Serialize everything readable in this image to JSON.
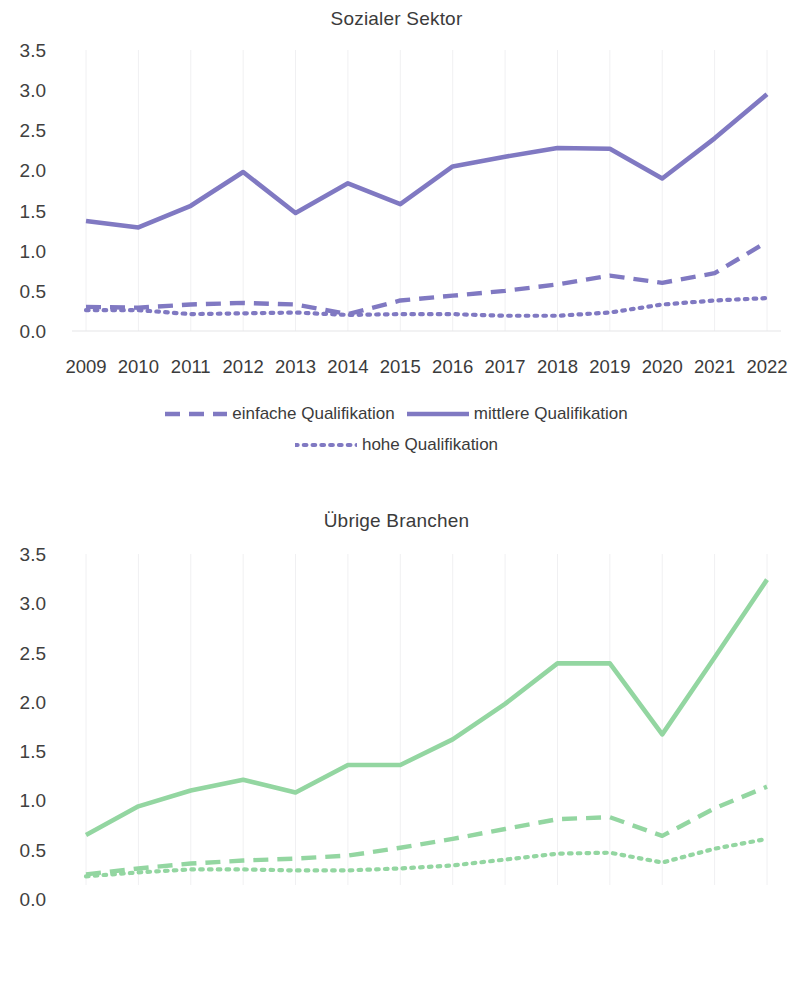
{
  "charts": [
    {
      "id": "sozialer-sektor",
      "title": "Sozialer Sektor",
      "color": "#8079c2",
      "legend_rows": [
        [
          "einfache Qualifikation",
          "mittlere Qualifikation"
        ],
        [
          "hohe Qualifikation"
        ]
      ]
    },
    {
      "id": "uebrige-branchen",
      "title": "Übrige Branchen",
      "color": "#93d6a1",
      "legend_rows": [
        [
          "einfache Qualifikation",
          "mittlere Qualifikation",
          "hohe Qualifikation"
        ]
      ]
    }
  ],
  "yticks": [
    "3.5",
    "3.0",
    "2.5",
    "2.0",
    "1.5",
    "1.0",
    "0.5",
    "0.0"
  ],
  "xticks": [
    "2009",
    "2010",
    "2011",
    "2012",
    "2013",
    "2014",
    "2015",
    "2016",
    "2017",
    "2018",
    "2019",
    "2020",
    "2021",
    "2022"
  ],
  "chart_data": [
    {
      "type": "line",
      "title": "Sozialer Sektor",
      "xlabel": "",
      "ylabel": "",
      "ylim": [
        0.0,
        3.5
      ],
      "ytick_values": [
        0.0,
        0.5,
        1.0,
        1.5,
        2.0,
        2.5,
        3.0,
        3.5
      ],
      "grid": true,
      "legend_position": "bottom",
      "color": "#8079c2",
      "categories": [
        "2009",
        "2010",
        "2011",
        "2012",
        "2013",
        "2014",
        "2015",
        "2016",
        "2017",
        "2018",
        "2019",
        "2020",
        "2021",
        "2022"
      ],
      "series": [
        {
          "name": "einfache Qualifikation",
          "style": "dashed",
          "values": [
            0.3,
            0.29,
            0.33,
            0.35,
            0.33,
            0.21,
            0.38,
            0.44,
            0.5,
            0.58,
            0.69,
            0.6,
            0.72,
            1.11
          ]
        },
        {
          "name": "mittlere Qualifikation",
          "style": "solid",
          "values": [
            1.37,
            1.29,
            1.56,
            1.98,
            1.47,
            1.84,
            1.58,
            2.05,
            2.17,
            2.28,
            2.27,
            1.9,
            2.4,
            2.95
          ]
        },
        {
          "name": "hohe Qualifikation",
          "style": "dotted",
          "values": [
            0.26,
            0.26,
            0.21,
            0.22,
            0.23,
            0.2,
            0.21,
            0.21,
            0.19,
            0.19,
            0.23,
            0.33,
            0.38,
            0.41
          ]
        }
      ]
    },
    {
      "type": "line",
      "title": "Übrige Branchen",
      "xlabel": "",
      "ylabel": "",
      "ylim": [
        0.0,
        3.5
      ],
      "ytick_values": [
        0.0,
        0.5,
        1.0,
        1.5,
        2.0,
        2.5,
        3.0,
        3.5
      ],
      "grid": true,
      "legend_position": "bottom",
      "color": "#93d6a1",
      "categories": [
        "2009",
        "2010",
        "2011",
        "2012",
        "2013",
        "2014",
        "2015",
        "2016",
        "2017",
        "2018",
        "2019",
        "2020",
        "2021",
        "2022"
      ],
      "series": [
        {
          "name": "einfache Qualifikation",
          "style": "dashed",
          "values": [
            0.25,
            0.31,
            0.36,
            0.39,
            0.41,
            0.44,
            0.52,
            0.61,
            0.71,
            0.81,
            0.83,
            0.64,
            0.92,
            1.14
          ]
        },
        {
          "name": "mittlere Qualifikation",
          "style": "solid",
          "values": [
            0.65,
            0.94,
            1.1,
            1.21,
            1.08,
            1.36,
            1.36,
            1.62,
            1.98,
            2.39,
            2.39,
            1.67,
            2.45,
            3.24
          ]
        },
        {
          "name": "hohe Qualifikation",
          "style": "dotted",
          "values": [
            0.23,
            0.27,
            0.3,
            0.3,
            0.29,
            0.29,
            0.31,
            0.34,
            0.4,
            0.46,
            0.47,
            0.37,
            0.51,
            0.61
          ]
        }
      ]
    }
  ]
}
